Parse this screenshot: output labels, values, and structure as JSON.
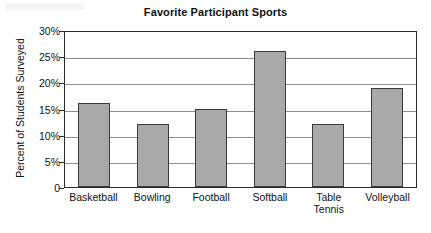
{
  "chart_data": {
    "type": "bar",
    "title": "Favorite Participant Sports",
    "xlabel": "",
    "ylabel": "Percent of Students Surveyed",
    "categories": [
      "Basketball",
      "Bowling",
      "Football",
      "Softball",
      "Table Tennis",
      "Volleyball"
    ],
    "category_lines": [
      [
        "Basketball"
      ],
      [
        "Bowling"
      ],
      [
        "Football"
      ],
      [
        "Softball"
      ],
      [
        "Table",
        "Tennis"
      ],
      [
        "Volleyball"
      ]
    ],
    "values": [
      16,
      12,
      15,
      26,
      12,
      19
    ],
    "ylim": [
      0,
      30
    ],
    "ytick_values": [
      0,
      5,
      10,
      15,
      20,
      25,
      30
    ],
    "ytick_labels": [
      "0",
      "5%",
      "10%",
      "15%",
      "20%",
      "25%",
      "30%"
    ],
    "grid": true,
    "legend": false,
    "bar_color": "#a9a9a9",
    "bar_border_color": "#3a3a3a",
    "axis_color": "#2b2b2b",
    "gridline_color": "#8d8d8d"
  }
}
